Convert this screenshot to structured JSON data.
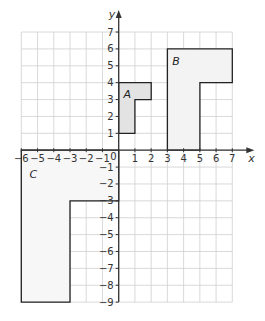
{
  "chart_data": {
    "type": "coordinate-grid",
    "title": "",
    "xlabel": "x",
    "ylabel": "y",
    "xlim": [
      -6,
      7
    ],
    "ylim": [
      -9,
      7
    ],
    "origin_label": "0",
    "x_ticks": [
      -6,
      -5,
      -4,
      -3,
      -2,
      -1,
      1,
      2,
      3,
      4,
      5,
      6,
      7
    ],
    "y_ticks": [
      7,
      6,
      5,
      4,
      3,
      2,
      1,
      -1,
      -2,
      -3,
      -4,
      -5,
      -6,
      -7,
      -8,
      -9
    ],
    "grid": true,
    "shapes": [
      {
        "name": "A",
        "fill": "#e3e3e3",
        "vertices": [
          [
            0,
            1
          ],
          [
            1,
            1
          ],
          [
            1,
            3
          ],
          [
            2,
            3
          ],
          [
            2,
            4
          ],
          [
            0,
            4
          ]
        ],
        "label_pos": [
          0.3,
          3.3
        ]
      },
      {
        "name": "B",
        "fill": "#f3f3f3",
        "vertices": [
          [
            3,
            0
          ],
          [
            5,
            0
          ],
          [
            5,
            4
          ],
          [
            7,
            4
          ],
          [
            7,
            6
          ],
          [
            3,
            6
          ]
        ],
        "label_pos": [
          3.3,
          5.3
        ]
      },
      {
        "name": "C",
        "fill": "#f7f7f7",
        "vertices": [
          [
            -6,
            0
          ],
          [
            0,
            0
          ],
          [
            0,
            -3
          ],
          [
            -3,
            -3
          ],
          [
            -3,
            -9
          ],
          [
            -6,
            -9
          ]
        ],
        "label_pos": [
          -5.5,
          -1.4
        ]
      }
    ]
  },
  "colors": {
    "grid": "#cfcfcf",
    "axis": "#333333",
    "outline": "#222222"
  }
}
